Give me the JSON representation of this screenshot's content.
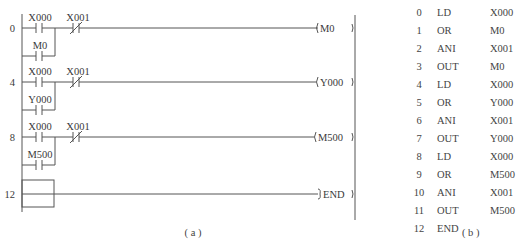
{
  "ladder_diagram": {
    "caption": "( a )",
    "rungs": [
      {
        "step": "0",
        "contact_no": "X000",
        "branch_no": "M0",
        "contact_nc": "X001",
        "coil": "M0"
      },
      {
        "step": "4",
        "contact_no": "X000",
        "branch_no": "Y000",
        "contact_nc": "X001",
        "coil": "Y000"
      },
      {
        "step": "8",
        "contact_no": "X000",
        "branch_no": "M500",
        "contact_nc": "X001",
        "coil": "M500"
      },
      {
        "step": "12",
        "instruction": "END"
      }
    ]
  },
  "instruction_list": {
    "caption": "( b )",
    "rows": [
      {
        "step": "0",
        "op": "LD",
        "arg": "X000"
      },
      {
        "step": "1",
        "op": "OR",
        "arg": "M0"
      },
      {
        "step": "2",
        "op": "ANI",
        "arg": "X001"
      },
      {
        "step": "3",
        "op": "OUT",
        "arg": "M0"
      },
      {
        "step": "4",
        "op": "LD",
        "arg": "X000"
      },
      {
        "step": "5",
        "op": "OR",
        "arg": "Y000"
      },
      {
        "step": "6",
        "op": "ANI",
        "arg": "X001"
      },
      {
        "step": "7",
        "op": "OUT",
        "arg": "Y000"
      },
      {
        "step": "8",
        "op": "LD",
        "arg": "X000"
      },
      {
        "step": "9",
        "op": "OR",
        "arg": "M500"
      },
      {
        "step": "10",
        "op": "ANI",
        "arg": "X001"
      },
      {
        "step": "11",
        "op": "OUT",
        "arg": "M500"
      },
      {
        "step": "12",
        "op": "END",
        "arg": ""
      }
    ]
  }
}
